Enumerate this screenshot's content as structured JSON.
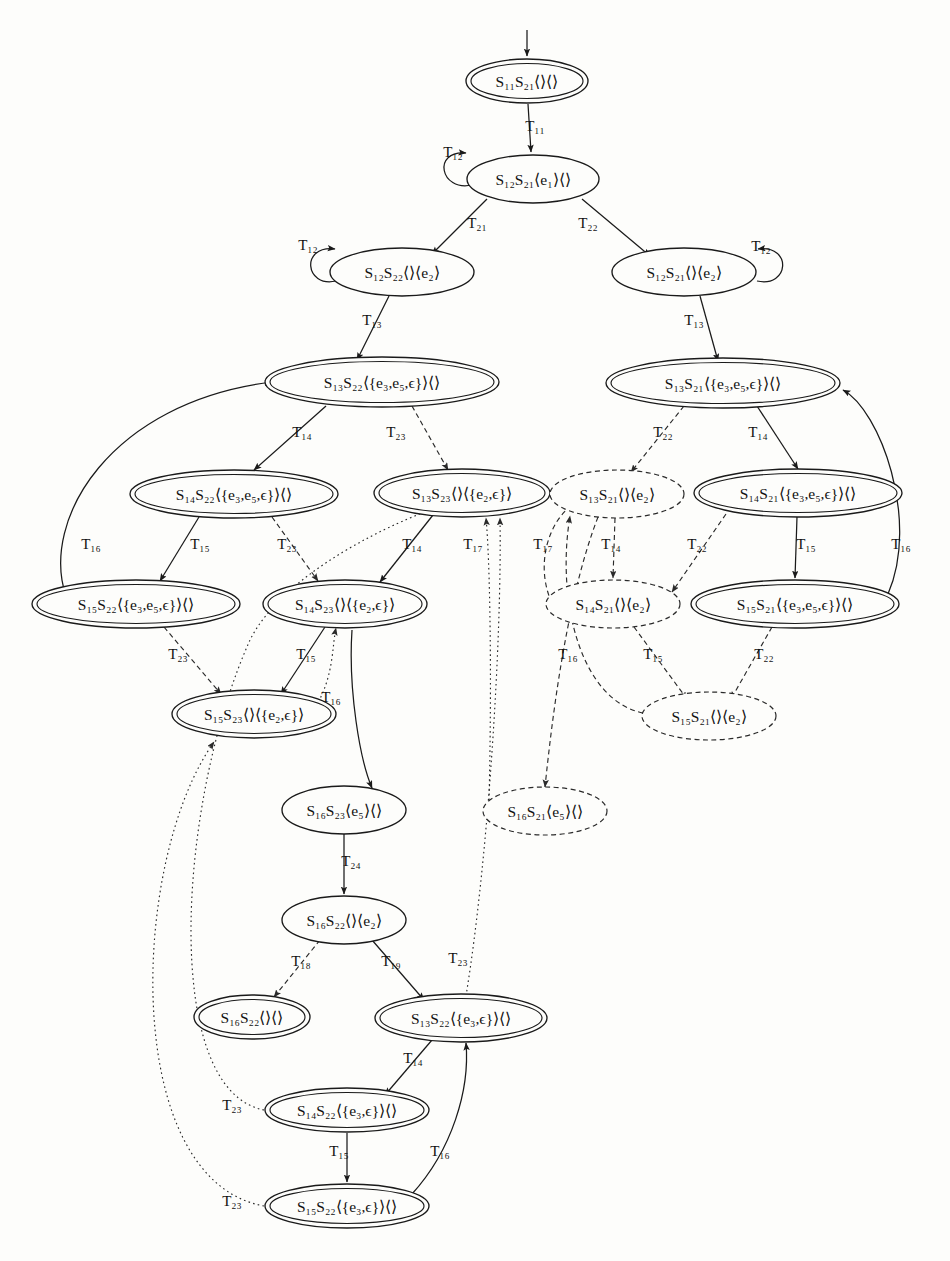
{
  "figure": {
    "type": "state-transition-diagram",
    "title": "",
    "legend": {
      "double_ellipse": "accepting / reachable composite state",
      "single_ellipse": "ordinary composite state",
      "dashed_ellipse": "pruned / infeasible composite state"
    },
    "entry_arrow": {
      "target_node_id": "n1"
    }
  },
  "nodes": [
    {
      "id": "n1",
      "label": "S₁₁S₂₁⟨⟩⟨⟩",
      "parts": {
        "s1": "S",
        "s1sub": "11",
        "s2": "S",
        "s2sub": "21",
        "q1": "⟨⟩",
        "q2": "⟨⟩"
      },
      "style": "double",
      "cx": 527,
      "cy": 81,
      "rx": 61,
      "ry": 22
    },
    {
      "id": "n2",
      "label": "S₁₂S₂₁⟨e₁⟩⟨⟩",
      "style": "single",
      "cx": 533,
      "cy": 179,
      "rx": 66,
      "ry": 24
    },
    {
      "id": "n3",
      "label": "S₁₂S₂₂⟨⟩⟨e₂⟩",
      "style": "single",
      "cx": 402,
      "cy": 272,
      "rx": 72,
      "ry": 24
    },
    {
      "id": "n4",
      "label": "S₁₂S₂₁⟨⟩⟨e₂⟩",
      "style": "single",
      "cx": 684,
      "cy": 272,
      "rx": 72,
      "ry": 24
    },
    {
      "id": "n5",
      "label": "S₁₃S₂₂⟨{e₃,e₅,ϵ}⟩⟨⟩",
      "style": "double",
      "cx": 382,
      "cy": 382,
      "rx": 117,
      "ry": 25
    },
    {
      "id": "n6",
      "label": "S₁₃S₂₁⟨{e₃,e₅,ϵ}⟩⟨⟩",
      "style": "double",
      "cx": 723,
      "cy": 383,
      "rx": 117,
      "ry": 25
    },
    {
      "id": "n7",
      "label": "S₁₄S₂₂⟨{e₃,e₅,ϵ}⟩⟨⟩",
      "style": "double",
      "cx": 234,
      "cy": 494,
      "rx": 104,
      "ry": 24
    },
    {
      "id": "n8",
      "label": "S₁₃S₂₃⟨⟩⟨{e₂,ϵ}⟩",
      "style": "double",
      "cx": 462,
      "cy": 493,
      "rx": 88,
      "ry": 24
    },
    {
      "id": "n9",
      "label": "S₁₃S₂₁⟨⟩⟨e₂⟩",
      "style": "dashed",
      "cx": 617,
      "cy": 494,
      "rx": 67,
      "ry": 24
    },
    {
      "id": "n10",
      "label": "S₁₄S₂₁⟨{e₃,e₅,ϵ}⟩⟨⟩",
      "style": "double",
      "cx": 798,
      "cy": 493,
      "rx": 104,
      "ry": 24
    },
    {
      "id": "n11",
      "label": "S₁₅S₂₂⟨{e₃,e₅,ϵ}⟩⟨⟩",
      "style": "double",
      "cx": 136,
      "cy": 604,
      "rx": 104,
      "ry": 24
    },
    {
      "id": "n12",
      "label": "S₁₄S₂₃⟨⟩⟨{e₂,ϵ}⟩",
      "style": "double",
      "cx": 345,
      "cy": 604,
      "rx": 82,
      "ry": 24
    },
    {
      "id": "n13",
      "label": "S₁₄S₂₁⟨⟩⟨e₂⟩",
      "style": "dashed",
      "cx": 613,
      "cy": 604,
      "rx": 67,
      "ry": 24
    },
    {
      "id": "n14",
      "label": "S₁₅S₂₁⟨{e₃,e₅,ϵ}⟩⟨⟩",
      "style": "double",
      "cx": 795,
      "cy": 604,
      "rx": 104,
      "ry": 24
    },
    {
      "id": "n15",
      "label": "S₁₅S₂₃⟨⟩⟨{e₂,ϵ}⟩",
      "style": "double",
      "cx": 254,
      "cy": 714,
      "rx": 82,
      "ry": 24
    },
    {
      "id": "n16",
      "label": "S₁₅S₂₁⟨⟩⟨e₂⟩",
      "style": "dashed",
      "cx": 709,
      "cy": 716,
      "rx": 67,
      "ry": 24
    },
    {
      "id": "n17",
      "label": "S₁₆S₂₃⟨e₅⟩⟨⟩",
      "style": "single",
      "cx": 344,
      "cy": 810,
      "rx": 62,
      "ry": 24
    },
    {
      "id": "n18",
      "label": "S₁₆S₂₁⟨e₅⟩⟨⟩",
      "style": "dashed",
      "cx": 545,
      "cy": 811,
      "rx": 62,
      "ry": 24
    },
    {
      "id": "n19",
      "label": "S₁₆S₂₂⟨⟩⟨e₂⟩",
      "style": "single",
      "cx": 344,
      "cy": 920,
      "rx": 62,
      "ry": 24
    },
    {
      "id": "n20",
      "label": "S₁₆S₂₂⟨⟩⟨⟩",
      "style": "double",
      "cx": 252,
      "cy": 1017,
      "rx": 58,
      "ry": 22
    },
    {
      "id": "n21",
      "label": "S₁₃S₂₂⟨{e₃,ϵ}⟩⟨⟩",
      "style": "double",
      "cx": 461,
      "cy": 1018,
      "rx": 86,
      "ry": 24
    },
    {
      "id": "n22",
      "label": "S₁₄S₂₂⟨{e₃,ϵ}⟩⟨⟩",
      "style": "double",
      "cx": 347,
      "cy": 1110,
      "rx": 82,
      "ry": 22
    },
    {
      "id": "n23",
      "label": "S₁₅S₂₂⟨{e₃,ϵ}⟩⟨⟩",
      "style": "double",
      "cx": 347,
      "cy": 1206,
      "rx": 82,
      "ry": 22
    }
  ],
  "edges": [
    {
      "from": "n1",
      "to": "n2",
      "label": "T₁₁",
      "style": "solid"
    },
    {
      "from": "n2",
      "to": "n2",
      "label": "T₁₂",
      "style": "solid",
      "kind": "self-loop"
    },
    {
      "from": "n2",
      "to": "n3",
      "label": "T₂₁",
      "style": "solid"
    },
    {
      "from": "n2",
      "to": "n4",
      "label": "T₂₂",
      "style": "solid"
    },
    {
      "from": "n3",
      "to": "n3",
      "label": "T₁₂",
      "style": "solid",
      "kind": "self-loop"
    },
    {
      "from": "n4",
      "to": "n4",
      "label": "T₁₂",
      "style": "solid",
      "kind": "self-loop"
    },
    {
      "from": "n3",
      "to": "n5",
      "label": "T₁₃",
      "style": "solid"
    },
    {
      "from": "n4",
      "to": "n6",
      "label": "T₁₃",
      "style": "solid"
    },
    {
      "from": "n5",
      "to": "n7",
      "label": "T₁₄",
      "style": "solid"
    },
    {
      "from": "n5",
      "to": "n8",
      "label": "T₂₃",
      "style": "dashed"
    },
    {
      "from": "n6",
      "to": "n9",
      "label": "T₂₂",
      "style": "dashed"
    },
    {
      "from": "n6",
      "to": "n10",
      "label": "T₁₄",
      "style": "solid"
    },
    {
      "from": "n7",
      "to": "n11",
      "label": "T₁₅",
      "style": "solid"
    },
    {
      "from": "n7",
      "to": "n12",
      "label": "T₂₃",
      "style": "dashed"
    },
    {
      "from": "n11",
      "to": "n5",
      "label": "T₁₆",
      "style": "solid"
    },
    {
      "from": "n8",
      "to": "n12",
      "label": "T₁₄",
      "style": "solid"
    },
    {
      "from": "n9",
      "to": "n13",
      "label": "T₁₄",
      "style": "dashed"
    },
    {
      "from": "n10",
      "to": "n13",
      "label": "T₂₂",
      "style": "dashed"
    },
    {
      "from": "n10",
      "to": "n14",
      "label": "T₁₅",
      "style": "solid"
    },
    {
      "from": "n14",
      "to": "n6",
      "label": "T₁₆",
      "style": "solid"
    },
    {
      "from": "n11",
      "to": "n15",
      "label": "T₂₃",
      "style": "dashed"
    },
    {
      "from": "n12",
      "to": "n15",
      "label": "T₁₅",
      "style": "solid"
    },
    {
      "from": "n13",
      "to": "n16",
      "label": "T₁₅",
      "style": "dashed"
    },
    {
      "from": "n14",
      "to": "n16",
      "label": "T₂₂",
      "style": "dashed"
    },
    {
      "from": "n16",
      "to": "n9",
      "label": "T₁₆",
      "style": "dashed"
    },
    {
      "from": "n13",
      "to": "n9",
      "label": "T₁₇",
      "style": "dashed"
    },
    {
      "from": "n9",
      "to": "n18",
      "label": "T₁₇",
      "style": "dashed"
    },
    {
      "from": "n15",
      "to": "n12",
      "label": "T₁₆",
      "style": "dotted"
    },
    {
      "from": "n12",
      "to": "n17",
      "label": "T₁₆",
      "style": "solid"
    },
    {
      "from": "n17",
      "to": "n19",
      "label": "T₂₄",
      "style": "solid"
    },
    {
      "from": "n19",
      "to": "n20",
      "label": "T₁₈",
      "style": "dashed"
    },
    {
      "from": "n19",
      "to": "n21",
      "label": "T₁₉",
      "style": "solid"
    },
    {
      "from": "n21",
      "to": "n8",
      "label": "T₂₃",
      "style": "dotted"
    },
    {
      "from": "n21",
      "to": "n22",
      "label": "T₁₄",
      "style": "solid"
    },
    {
      "from": "n22",
      "to": "n23",
      "label": "T₁₅",
      "style": "solid"
    },
    {
      "from": "n23",
      "to": "n21",
      "label": "T₁₆",
      "style": "solid"
    },
    {
      "from": "n22",
      "to": "n8",
      "label": "T₂₃",
      "style": "dotted"
    },
    {
      "from": "n23",
      "to": "n15",
      "label": "T₂₃",
      "style": "dotted"
    },
    {
      "from": "n8",
      "to": "n8",
      "label": "T₁₇",
      "style": "solid",
      "kind": "incoming"
    }
  ],
  "edge_labels_rendered": [
    {
      "id": "e_T11",
      "text": "T₁₁",
      "x": 535,
      "y": 131
    },
    {
      "id": "e_T12a",
      "text": "T₁₂",
      "x": 453,
      "y": 157
    },
    {
      "id": "e_T21",
      "text": "T₂₁",
      "x": 477,
      "y": 228
    },
    {
      "id": "e_T22a",
      "text": "T₂₂",
      "x": 588,
      "y": 228
    },
    {
      "id": "e_T12b",
      "text": "T₁₂",
      "x": 308,
      "y": 250
    },
    {
      "id": "e_T12c",
      "text": "T₁₂",
      "x": 761,
      "y": 251
    },
    {
      "id": "e_T13a",
      "text": "T₁₃",
      "x": 372,
      "y": 325
    },
    {
      "id": "e_T13b",
      "text": "T₁₃",
      "x": 694,
      "y": 325
    },
    {
      "id": "e_T14a",
      "text": "T₁₄",
      "x": 302,
      "y": 437
    },
    {
      "id": "e_T23a",
      "text": "T₂₃",
      "x": 396,
      "y": 437
    },
    {
      "id": "e_T22b",
      "text": "T₂₂",
      "x": 663,
      "y": 437
    },
    {
      "id": "e_T14b",
      "text": "T₁₄",
      "x": 758,
      "y": 437
    },
    {
      "id": "e_T16a",
      "text": "T₁₆",
      "x": 91,
      "y": 549
    },
    {
      "id": "e_T15a",
      "text": "T₁₅",
      "x": 200,
      "y": 549
    },
    {
      "id": "e_T23b",
      "text": "T₂₃",
      "x": 287,
      "y": 549
    },
    {
      "id": "e_T14c",
      "text": "T₁₄",
      "x": 412,
      "y": 549
    },
    {
      "id": "e_T17a",
      "text": "T₁₇",
      "x": 473,
      "y": 549
    },
    {
      "id": "e_T17b",
      "text": "T₁₇",
      "x": 543,
      "y": 549
    },
    {
      "id": "e_T14d",
      "text": "T₁₄",
      "x": 611,
      "y": 549
    },
    {
      "id": "e_T22c",
      "text": "T₂₂",
      "x": 697,
      "y": 549
    },
    {
      "id": "e_T15b",
      "text": "T₁₅",
      "x": 806,
      "y": 549
    },
    {
      "id": "e_T16b",
      "text": "T₁₆",
      "x": 901,
      "y": 549
    },
    {
      "id": "e_T23c",
      "text": "T₂₃",
      "x": 178,
      "y": 659
    },
    {
      "id": "e_T15c",
      "text": "T₁₅",
      "x": 306,
      "y": 659
    },
    {
      "id": "e_T16c",
      "text": "T₁₆",
      "x": 331,
      "y": 702
    },
    {
      "id": "e_T16d",
      "text": "T₁₆",
      "x": 568,
      "y": 659
    },
    {
      "id": "e_T15d",
      "text": "T₁₅",
      "x": 653,
      "y": 659
    },
    {
      "id": "e_T22d",
      "text": "T₂₂",
      "x": 764,
      "y": 659
    },
    {
      "id": "e_T24",
      "text": "T₂₄",
      "x": 351,
      "y": 866
    },
    {
      "id": "e_T18",
      "text": "T₁₈",
      "x": 301,
      "y": 966
    },
    {
      "id": "e_T19",
      "text": "T₁₉",
      "x": 391,
      "y": 966
    },
    {
      "id": "e_T23d",
      "text": "T₂₃",
      "x": 458,
      "y": 963
    },
    {
      "id": "e_T14e",
      "text": "T₁₄",
      "x": 413,
      "y": 1063
    },
    {
      "id": "e_T23e",
      "text": "T₂₃",
      "x": 232,
      "y": 1110
    },
    {
      "id": "e_T15e",
      "text": "T₁₅",
      "x": 339,
      "y": 1156
    },
    {
      "id": "e_T16e",
      "text": "T₁₆",
      "x": 440,
      "y": 1156
    },
    {
      "id": "e_T23f",
      "text": "T₂₃",
      "x": 232,
      "y": 1206
    }
  ]
}
